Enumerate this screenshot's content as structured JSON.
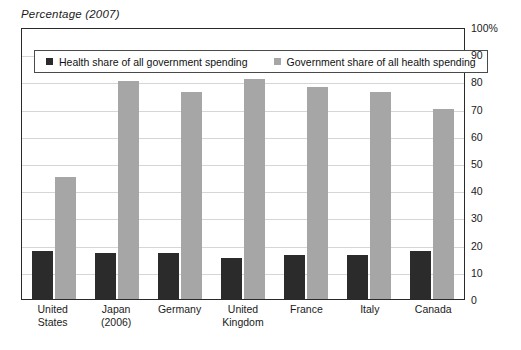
{
  "chart_data": {
    "type": "bar",
    "title": "Percentage (2007)",
    "xlabel": "",
    "ylabel": "",
    "ylim": [
      0,
      100
    ],
    "yticks": [
      "0",
      "10",
      "20",
      "30",
      "40",
      "50",
      "60",
      "70",
      "80",
      "90",
      "100%"
    ],
    "grid": true,
    "legend_position": "top-left-inside",
    "categories": [
      "United States",
      "Japan (2006)",
      "Germany",
      "United Kingdom",
      "France",
      "Italy",
      "Canada"
    ],
    "category_lines": [
      [
        "United",
        "States"
      ],
      [
        "Japan",
        "(2006)"
      ],
      [
        "Germany"
      ],
      [
        "United",
        "Kingdom"
      ],
      [
        "France"
      ],
      [
        "Italy"
      ],
      [
        "Canada"
      ]
    ],
    "series": [
      {
        "name": "Health share of all government spending",
        "color": "#2b2b2b",
        "values": [
          17.5,
          17,
          17,
          15,
          16,
          16,
          17.5
        ]
      },
      {
        "name": "Government share of all health spending",
        "color": "#a6a6a6",
        "values": [
          45,
          80,
          76,
          81,
          78,
          76,
          70
        ]
      }
    ]
  },
  "legend": {
    "items": [
      {
        "label": "Health share of all government spending",
        "swatch": "dark"
      },
      {
        "label": "Government share of all health spending",
        "swatch": "light"
      }
    ]
  },
  "colors": {
    "dark_series": "#2b2b2b",
    "light_series": "#a6a6a6",
    "gridline": "#d6d6d6",
    "frame": "#2a2a2a",
    "background": "#ffffff"
  }
}
